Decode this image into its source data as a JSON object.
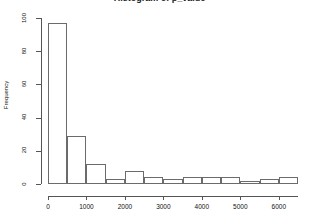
{
  "chart_data": {
    "type": "bar",
    "title": "Histogram of p_value",
    "xlabel": "",
    "ylabel": "Frequency",
    "categories": [
      "0-500",
      "500-1000",
      "1000-1500",
      "1500-2000",
      "2000-2500",
      "2500-3000",
      "3000-3500",
      "3500-4000",
      "4000-4500",
      "4500-5000",
      "5000-5500",
      "5500-6000",
      "6000-6500"
    ],
    "bin_starts": [
      0,
      500,
      1000,
      1500,
      2000,
      2500,
      3000,
      3500,
      4000,
      4500,
      5000,
      5500,
      6000
    ],
    "bin_width": 500,
    "values": [
      97,
      29,
      12,
      3,
      8,
      4,
      3,
      4,
      4,
      4,
      2,
      3,
      4
    ],
    "xlim": [
      0,
      6500
    ],
    "ylim": [
      0,
      100
    ],
    "x_ticks": [
      0,
      1000,
      2000,
      3000,
      4000,
      5000,
      6000
    ],
    "x_tick_labels": [
      "0",
      "1000",
      "2000",
      "3000",
      "4000",
      "5000",
      "6000"
    ],
    "y_ticks": [
      0,
      20,
      40,
      60,
      80,
      100
    ],
    "y_tick_labels": [
      "0",
      "20",
      "40",
      "60",
      "80",
      "100"
    ],
    "grid": false,
    "legend": null,
    "bar_edge_color": "#6b6b6b",
    "bar_fill_color": "#ffffff",
    "axis_color": "#555555"
  }
}
